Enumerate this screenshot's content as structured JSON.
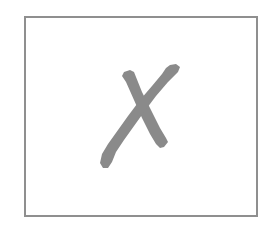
{
  "figure": {
    "frame": {
      "border_color": "#8f8f8f",
      "background": "#ffffff"
    },
    "mark": {
      "icon": "x-mark-icon",
      "color": "#8a8a8a",
      "style": "hand-drawn brush stroke"
    }
  }
}
